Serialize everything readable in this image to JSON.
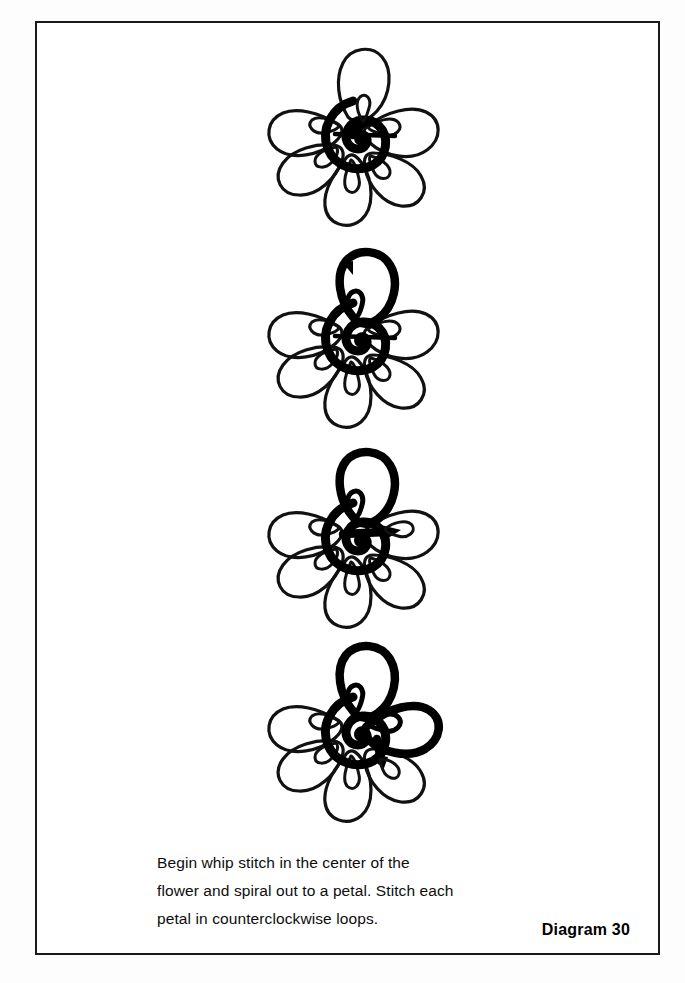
{
  "page": {
    "background_color": "#ffffff",
    "frame_color": "#1a1a1a",
    "ink_color": "#000000"
  },
  "caption": {
    "text": "Begin whip stitch in the center of the\nflower and spiral out to a petal. Stitch each\npetal in counterclockwise loops."
  },
  "diagram_label": {
    "text": "Diagram 30"
  },
  "figures": [
    {
      "id": "flower-step-1",
      "step": 1,
      "description": "Six-petal flower outline with bold spiral worked in the center and a short arrow leaving the spiral toward the top petal.",
      "petal_count": 6,
      "completed_petals": 0,
      "arrow": "up-right-from-center",
      "center": "bold-spiral"
    },
    {
      "id": "flower-step-2",
      "step": 2,
      "description": "Stitch travels out of the spiral, loops at the petal base and outlines the top petal in bold; arrowhead at the top-left of that petal.",
      "petal_count": 6,
      "completed_petals": 1,
      "arrow": "top-left-of-top-petal",
      "center": "bold-spiral"
    },
    {
      "id": "flower-step-3",
      "step": 3,
      "description": "Top petal finished in bold; a horizontal arrow points right from the center toward the next petal.",
      "petal_count": 6,
      "completed_petals": 1,
      "arrow": "right-toward-next-petal",
      "center": "bold-spiral"
    },
    {
      "id": "flower-step-4",
      "step": 4,
      "description": "Top petal and upper-right petal both worked in bold counterclockwise loops; stitch returning to the center.",
      "petal_count": 6,
      "completed_petals": 2,
      "arrow": "down-into-center",
      "center": "bold-spiral"
    }
  ]
}
